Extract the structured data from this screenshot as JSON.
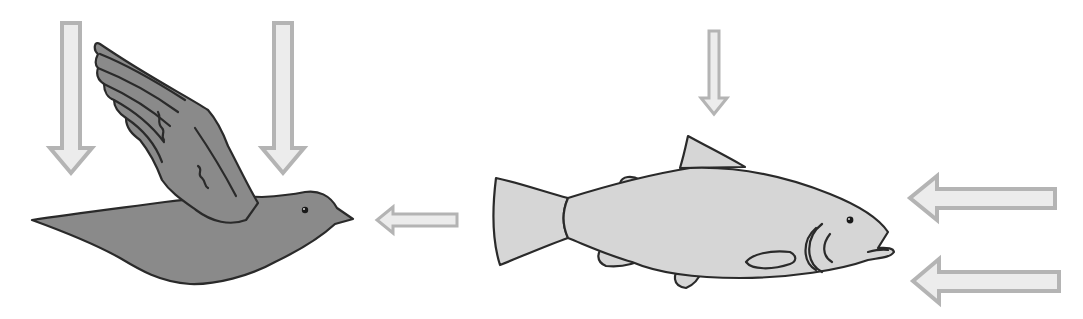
{
  "diagram": {
    "colors": {
      "background": "#ffffff",
      "arrow_fill": "#ececec",
      "arrow_stroke": "#b4b4b4",
      "bird_fill": "#8a8a8a",
      "fish_fill": "#d6d6d6",
      "outline": "#2a2a2a"
    },
    "organisms": [
      {
        "id": "bird",
        "label": "bird"
      },
      {
        "id": "fish",
        "label": "fish"
      }
    ],
    "arrows": [
      {
        "id": "bird-down-left",
        "direction": "down",
        "target": "bird"
      },
      {
        "id": "bird-down-right",
        "direction": "down",
        "target": "bird"
      },
      {
        "id": "fish-to-bird",
        "direction": "left",
        "from": "fish",
        "target": "bird"
      },
      {
        "id": "fish-down",
        "direction": "down",
        "target": "fish"
      },
      {
        "id": "fish-left-upper",
        "direction": "left",
        "target": "fish"
      },
      {
        "id": "fish-left-lower",
        "direction": "left",
        "target": "fish"
      }
    ]
  }
}
